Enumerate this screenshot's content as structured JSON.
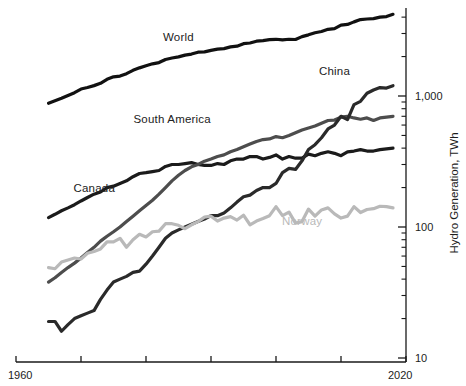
{
  "chart_data": {
    "type": "line",
    "title": "",
    "subtitle": "",
    "xlabel": "",
    "ylabel": "Hydro Generation, TWh",
    "yscale": "log",
    "ylim": [
      10,
      5000
    ],
    "xlim": [
      1960,
      2020
    ],
    "grid": false,
    "legend_position": "inline-annotations",
    "x_tick_labels": [
      "1960",
      "2020"
    ],
    "x_ticks": [
      1960,
      1970,
      1980,
      1990,
      2000,
      2010,
      2020
    ],
    "y_tick_labels": [
      "10",
      "100",
      "1,000"
    ],
    "y_ticks": [
      10,
      100,
      1000
    ],
    "y_minor_ticks": [
      20,
      30,
      40,
      50,
      60,
      70,
      80,
      90,
      200,
      300,
      400,
      500,
      600,
      700,
      800,
      900,
      2000,
      3000,
      4000
    ],
    "series": [
      {
        "name": "World",
        "color": "#111111",
        "label_x": 1985,
        "label_y": 2700,
        "x": [
          1965,
          1966,
          1967,
          1968,
          1969,
          1970,
          1971,
          1972,
          1973,
          1974,
          1975,
          1976,
          1977,
          1978,
          1979,
          1980,
          1981,
          1982,
          1983,
          1984,
          1985,
          1986,
          1987,
          1988,
          1989,
          1990,
          1991,
          1992,
          1993,
          1994,
          1995,
          1996,
          1997,
          1998,
          1999,
          2000,
          2001,
          2002,
          2003,
          2004,
          2005,
          2006,
          2007,
          2008,
          2009,
          2010,
          2011,
          2012,
          2013,
          2014,
          2015,
          2016,
          2017,
          2018
        ],
        "values": [
          880,
          920,
          960,
          1010,
          1060,
          1130,
          1160,
          1200,
          1250,
          1340,
          1400,
          1420,
          1480,
          1570,
          1640,
          1700,
          1760,
          1800,
          1900,
          1950,
          1990,
          2050,
          2090,
          2160,
          2170,
          2230,
          2280,
          2300,
          2370,
          2400,
          2510,
          2540,
          2620,
          2650,
          2690,
          2710,
          2680,
          2710,
          2700,
          2840,
          2930,
          3040,
          3110,
          3230,
          3270,
          3480,
          3520,
          3680,
          3830,
          3870,
          3900,
          4000,
          4040,
          4200
        ]
      },
      {
        "name": "Canada",
        "color": "#1b1b1b",
        "label_x": 1972,
        "label_y": 190,
        "x": [
          1965,
          1966,
          1967,
          1968,
          1969,
          1970,
          1971,
          1972,
          1973,
          1974,
          1975,
          1976,
          1977,
          1978,
          1979,
          1980,
          1981,
          1982,
          1983,
          1984,
          1985,
          1986,
          1987,
          1988,
          1989,
          1990,
          1991,
          1992,
          1993,
          1994,
          1995,
          1996,
          1997,
          1998,
          1999,
          2000,
          2001,
          2002,
          2003,
          2004,
          2005,
          2006,
          2007,
          2008,
          2009,
          2010,
          2011,
          2012,
          2013,
          2014,
          2015,
          2016,
          2017,
          2018
        ],
        "values": [
          118,
          125,
          133,
          140,
          148,
          158,
          168,
          178,
          185,
          200,
          205,
          215,
          225,
          242,
          256,
          260,
          265,
          270,
          290,
          300,
          300,
          305,
          310,
          300,
          295,
          295,
          305,
          300,
          320,
          330,
          330,
          345,
          345,
          330,
          340,
          355,
          330,
          345,
          335,
          335,
          360,
          350,
          365,
          375,
          365,
          350,
          375,
          380,
          390,
          380,
          380,
          390,
          395,
          400
        ]
      },
      {
        "name": "South America",
        "color": "#4d4d4d",
        "label_x": 1984,
        "label_y": 640,
        "x": [
          1965,
          1966,
          1967,
          1968,
          1969,
          1970,
          1971,
          1972,
          1973,
          1974,
          1975,
          1976,
          1977,
          1978,
          1979,
          1980,
          1981,
          1982,
          1983,
          1984,
          1985,
          1986,
          1987,
          1988,
          1989,
          1990,
          1991,
          1992,
          1993,
          1994,
          1995,
          1996,
          1997,
          1998,
          1999,
          2000,
          2001,
          2002,
          2003,
          2004,
          2005,
          2006,
          2007,
          2008,
          2009,
          2010,
          2011,
          2012,
          2013,
          2014,
          2015,
          2016,
          2017,
          2018
        ],
        "values": [
          38,
          41,
          45,
          49,
          53,
          58,
          64,
          70,
          78,
          85,
          92,
          100,
          110,
          121,
          133,
          146,
          160,
          178,
          200,
          225,
          248,
          270,
          288,
          300,
          318,
          330,
          345,
          355,
          375,
          390,
          410,
          430,
          450,
          465,
          470,
          490,
          480,
          500,
          525,
          550,
          570,
          590,
          620,
          650,
          655,
          690,
          700,
          680,
          665,
          680,
          650,
          680,
          690,
          700
        ]
      },
      {
        "name": "China",
        "color": "#2a2a2a",
        "label_x": 2009,
        "label_y": 1500,
        "x": [
          1965,
          1966,
          1967,
          1968,
          1969,
          1970,
          1971,
          1972,
          1973,
          1974,
          1975,
          1976,
          1977,
          1978,
          1979,
          1980,
          1981,
          1982,
          1983,
          1984,
          1985,
          1986,
          1987,
          1988,
          1989,
          1990,
          1991,
          1992,
          1993,
          1994,
          1995,
          1996,
          1997,
          1998,
          1999,
          2000,
          2001,
          2002,
          2003,
          2004,
          2005,
          2006,
          2007,
          2008,
          2009,
          2010,
          2011,
          2012,
          2013,
          2014,
          2015,
          2016,
          2017,
          2018
        ],
        "values": [
          19,
          19,
          16,
          18,
          20,
          21,
          22,
          23,
          28,
          33,
          38,
          40,
          42,
          45,
          46,
          52,
          60,
          70,
          82,
          90,
          95,
          100,
          105,
          110,
          115,
          122,
          122,
          128,
          140,
          155,
          170,
          175,
          190,
          200,
          200,
          215,
          260,
          280,
          275,
          320,
          390,
          425,
          480,
          560,
          600,
          700,
          660,
          860,
          910,
          1050,
          1110,
          1160,
          1150,
          1200
        ]
      },
      {
        "name": "Norway",
        "color": "#b9b9b9",
        "label_x": 2004,
        "label_y": 108,
        "x": [
          1965,
          1966,
          1967,
          1968,
          1969,
          1970,
          1971,
          1972,
          1973,
          1974,
          1975,
          1976,
          1977,
          1978,
          1979,
          1980,
          1981,
          1982,
          1983,
          1984,
          1985,
          1986,
          1987,
          1988,
          1989,
          1990,
          1991,
          1992,
          1993,
          1994,
          1995,
          1996,
          1997,
          1998,
          1999,
          2000,
          2001,
          2002,
          2003,
          2004,
          2005,
          2006,
          2007,
          2008,
          2009,
          2010,
          2011,
          2012,
          2013,
          2014,
          2015,
          2016,
          2017,
          2018
        ],
        "values": [
          49,
          48,
          54,
          56,
          58,
          57,
          63,
          65,
          68,
          77,
          77,
          82,
          70,
          80,
          88,
          84,
          92,
          93,
          106,
          106,
          103,
          97,
          104,
          110,
          119,
          121,
          111,
          117,
          120,
          113,
          123,
          104,
          111,
          116,
          122,
          143,
          122,
          130,
          107,
          110,
          137,
          121,
          135,
          140,
          126,
          117,
          121,
          143,
          129,
          136,
          138,
          144,
          143,
          140
        ]
      }
    ]
  },
  "axis": {
    "y_title": "Hydro Generation, TWh",
    "x_start_label": "1960",
    "x_end_label": "2020",
    "y_label_1000": "1,000",
    "y_label_100": "100",
    "y_label_10": "10"
  },
  "annotations": {
    "world": "World",
    "china": "China",
    "south_america": "South America",
    "canada": "Canada",
    "norway": "Norway"
  },
  "colors": {
    "world": "#111111",
    "canada": "#1b1b1b",
    "south_america": "#4d4d4d",
    "china": "#2a2a2a",
    "norway": "#b9b9b9",
    "axis": "#1a1a1a",
    "background": "#ffffff"
  }
}
